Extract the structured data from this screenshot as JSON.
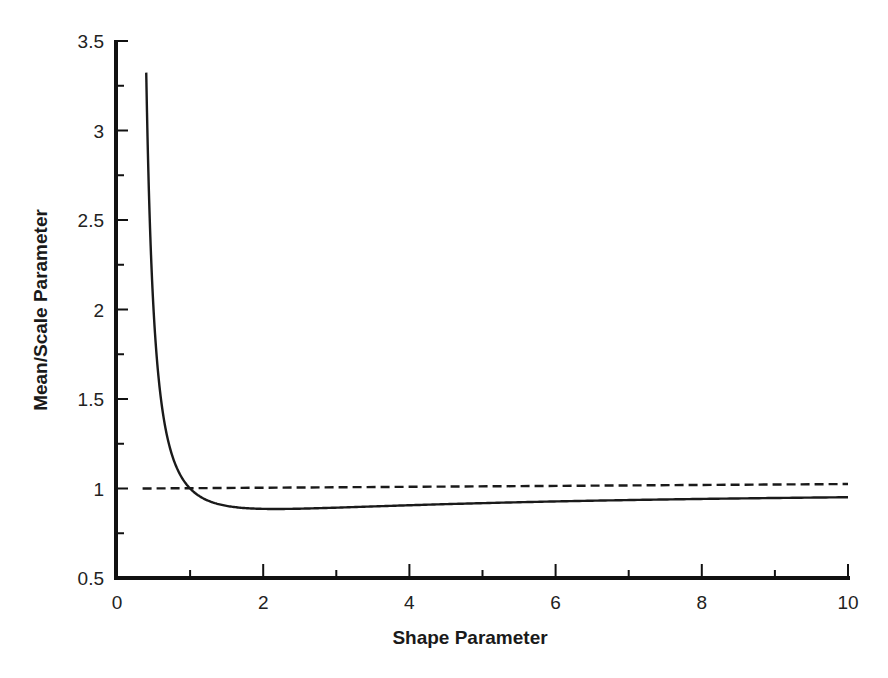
{
  "chart_data": {
    "type": "line",
    "title": "",
    "xlabel": "Shape Parameter",
    "ylabel": "Mean/Scale Parameter",
    "xlim": [
      0,
      10
    ],
    "ylim": [
      0.5,
      3.5
    ],
    "x_ticks": [
      0,
      2,
      4,
      6,
      8,
      10
    ],
    "x_tick_labels": [
      "0",
      "2",
      "4",
      "6",
      "8",
      "10"
    ],
    "x_minor_ticks": [
      1,
      3,
      5,
      7,
      9
    ],
    "y_ticks": [
      0.5,
      1,
      1.5,
      2,
      2.5,
      3,
      3.5
    ],
    "y_tick_labels": [
      "0.5",
      "1",
      "1.5",
      "2",
      "2.5",
      "3",
      "3.5"
    ],
    "y_minor_ticks": [
      0.75,
      1.25,
      1.75,
      2.25,
      2.75,
      3.25
    ],
    "grid": false,
    "legend": null,
    "series": [
      {
        "name": "Mean/Scale ratio (solid)",
        "style": "solid",
        "color": "#1a1a1a",
        "x": [
          0.4,
          0.45,
          0.5,
          0.6,
          0.7,
          0.8,
          0.9,
          1.0,
          1.2,
          1.5,
          2.0,
          2.17,
          2.5,
          3.0,
          4.0,
          5.0,
          6.0,
          7.0,
          8.0,
          9.0,
          10.0
        ],
        "y": [
          3.323,
          2.568,
          2.0,
          1.505,
          1.266,
          1.133,
          1.052,
          1.0,
          0.941,
          0.903,
          0.886,
          0.886,
          0.887,
          0.893,
          0.906,
          0.918,
          0.927,
          0.935,
          0.942,
          0.947,
          0.951
        ]
      },
      {
        "name": "Reference line (dashed)",
        "style": "dashed",
        "color": "#1a1a1a",
        "x": [
          0.35,
          10.0
        ],
        "y": [
          1.0,
          1.025
        ]
      }
    ]
  }
}
